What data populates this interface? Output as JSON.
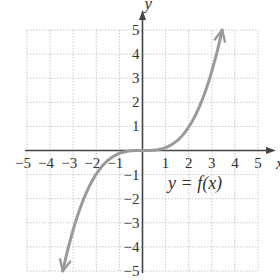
{
  "chart_data": {
    "type": "line",
    "title": "",
    "xlabel": "x",
    "ylabel": "y",
    "xlim": [
      -5,
      5
    ],
    "ylim": [
      -5,
      5
    ],
    "grid": true,
    "x_ticks": [
      -5,
      -4,
      -3,
      -2,
      -1,
      1,
      2,
      3,
      4,
      5
    ],
    "y_ticks": [
      -5,
      -4,
      -3,
      -2,
      -1,
      1,
      2,
      3,
      4,
      5
    ],
    "annotation": "y = f(x)",
    "series": [
      {
        "name": "y = f(x)",
        "description": "cubic-shaped curve, flat near origin, arrows at both ends",
        "color": "#9a9a9a",
        "x": [
          -3.45,
          -3,
          -2.5,
          -2,
          -1.5,
          -1,
          -0.5,
          0,
          0.5,
          1,
          1.5,
          2,
          2.5,
          3,
          3.45
        ],
        "y": [
          -5,
          -3.3,
          -1.9,
          -0.98,
          -0.41,
          -0.12,
          -0.02,
          0,
          0.02,
          0.12,
          0.41,
          0.98,
          1.9,
          3.3,
          5
        ]
      }
    ]
  },
  "labels": {
    "x_axis": "x",
    "y_axis": "y",
    "function": "y = f(x)"
  },
  "colors": {
    "axis": "#444444",
    "grid": "#c8c8c8",
    "curve": "#9a9a9a",
    "text": "#333333"
  }
}
